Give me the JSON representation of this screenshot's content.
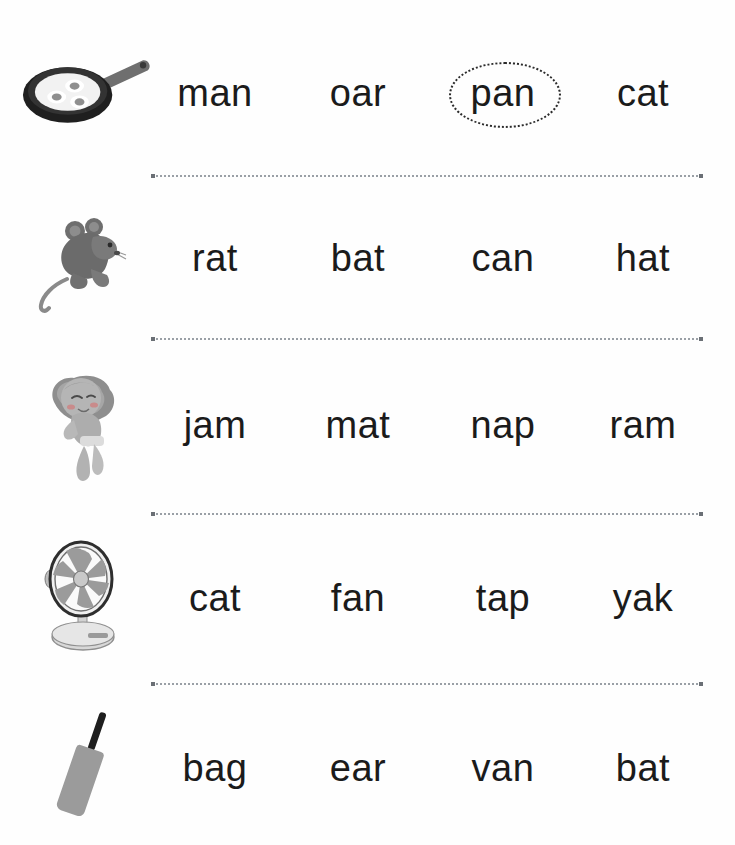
{
  "worksheet": {
    "title": "Phonics word picture matching worksheet",
    "background_color": "#ffffff",
    "text_color": "#1b1b1b",
    "separator_color": "#9aa0a6",
    "circle_color": "#2b2b2b",
    "columns": 4,
    "rows_count": 5
  },
  "rows": [
    {
      "picture": "frying-pan-with-eggs-image",
      "answer": "pan",
      "words": [
        {
          "text": "man",
          "circled": false
        },
        {
          "text": "oar",
          "circled": false
        },
        {
          "text": "pan",
          "circled": true
        },
        {
          "text": "cat",
          "circled": false
        }
      ]
    },
    {
      "picture": "rat-image",
      "answer": "rat",
      "words": [
        {
          "text": "rat",
          "circled": false
        },
        {
          "text": "bat",
          "circled": false
        },
        {
          "text": "can",
          "circled": false
        },
        {
          "text": "hat",
          "circled": false
        }
      ]
    },
    {
      "picture": "sleeping-baby-nap-image",
      "answer": "nap",
      "words": [
        {
          "text": "jam",
          "circled": false
        },
        {
          "text": "mat",
          "circled": false
        },
        {
          "text": "nap",
          "circled": false
        },
        {
          "text": "ram",
          "circled": false
        }
      ]
    },
    {
      "picture": "table-fan-image",
      "answer": "fan",
      "words": [
        {
          "text": "cat",
          "circled": false
        },
        {
          "text": "fan",
          "circled": false
        },
        {
          "text": "tap",
          "circled": false
        },
        {
          "text": "yak",
          "circled": false
        }
      ]
    },
    {
      "picture": "cricket-bat-image",
      "answer": "bat",
      "words": [
        {
          "text": "bag",
          "circled": false
        },
        {
          "text": "ear",
          "circled": false
        },
        {
          "text": "van",
          "circled": false
        },
        {
          "text": "bat",
          "circled": false
        }
      ]
    }
  ]
}
